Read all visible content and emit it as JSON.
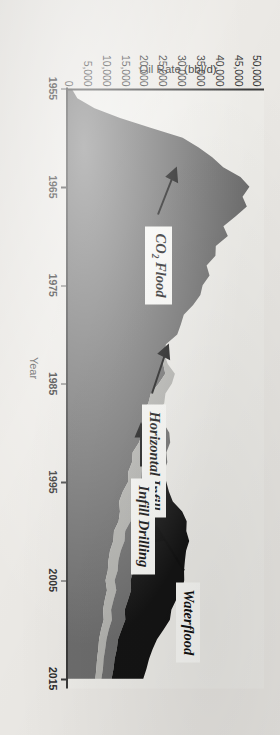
{
  "figure": {
    "rotation_deg": 90,
    "background_hex": "#eceae6"
  },
  "axes": {
    "x_title": "Year",
    "y_title": "Oil Rate (bbl/d)",
    "x_ticks": [
      "1955",
      "1965",
      "1975",
      "1985",
      "1995",
      "2005",
      "2015"
    ],
    "y_ticks": [
      "0",
      "5,000",
      "10,000",
      "15,000",
      "20,000",
      "25,000",
      "30,000",
      "35,000",
      "40,000",
      "45,000",
      "50,000"
    ],
    "axis_color_hex": "#3b3b3b"
  },
  "annotations": [
    {
      "id": "co2-flood",
      "label_html": "CO<sub>2</sub> Flood",
      "label_text": "CO2 Flood"
    },
    {
      "id": "horizontal-infill",
      "label_html": "Horizontal Infill",
      "label_text": "Horizontal Infill"
    },
    {
      "id": "infill-drilling",
      "label_html": "Infill Drilling",
      "label_text": "Infill Drilling"
    },
    {
      "id": "waterflood",
      "label_html": "Waterflood",
      "label_text": "Waterflood"
    }
  ],
  "chart_data": {
    "type": "area",
    "title": "",
    "subtitle": "",
    "xlabel": "Year",
    "ylabel": "Oil Rate (bbl/d)",
    "xlim": [
      1955,
      2016
    ],
    "ylim": [
      0,
      52000
    ],
    "grid": false,
    "legend_position": "none",
    "stacked": true,
    "series": [
      {
        "name": "Waterflood",
        "color_hex": "#6e6e6e",
        "values": [
          900,
          2600,
          7000,
          14000,
          22000,
          30000,
          36000,
          39000,
          41000,
          43500,
          46500,
          48000,
          45000,
          43000,
          41500,
          40500,
          39500,
          38500,
          37500,
          36500,
          35500,
          34500,
          33500,
          32000,
          30500,
          29000,
          27500,
          26500,
          25500,
          24500,
          23500,
          22500,
          21500,
          20500,
          19500,
          18800,
          18000,
          17200,
          16500,
          15800,
          15200,
          14600,
          14000,
          13500,
          13000,
          12500,
          12000,
          11600,
          11200,
          10800,
          10400,
          10000,
          9700,
          9400,
          9100,
          8800,
          8500,
          8200,
          8000,
          7800,
          7600
        ]
      },
      {
        "name": "Infill Drilling",
        "color_hex": "#b4b4b0",
        "values": [
          0,
          0,
          0,
          0,
          0,
          0,
          0,
          0,
          0,
          0,
          0,
          0,
          0,
          0,
          0,
          0,
          0,
          0,
          0,
          0,
          0,
          0,
          0,
          0,
          0,
          0,
          0,
          0,
          1200,
          2600,
          3400,
          3900,
          4100,
          4200,
          4100,
          4000,
          3900,
          3800,
          3700,
          3600,
          3500,
          3400,
          3300,
          3200,
          3100,
          3000,
          2900,
          2800,
          2700,
          2600,
          2500,
          2400,
          2300,
          2200,
          2100,
          2000,
          1900,
          1800,
          1750,
          1700,
          1650
        ]
      },
      {
        "name": "Horizontal Infill",
        "color_hex": "#6e6e6e",
        "values": [
          0,
          0,
          0,
          0,
          0,
          0,
          0,
          0,
          0,
          0,
          0,
          0,
          0,
          0,
          0,
          0,
          0,
          0,
          0,
          0,
          0,
          0,
          0,
          0,
          0,
          0,
          0,
          0,
          0,
          0,
          0,
          0,
          0,
          0,
          1500,
          3200,
          4400,
          5200,
          5600,
          5800,
          5900,
          5800,
          5700,
          5500,
          5300,
          5100,
          4900,
          4700,
          4500,
          4300,
          4100,
          3900,
          3750,
          3600,
          3450,
          3300,
          3150,
          3000,
          2900,
          2800,
          2700
        ]
      },
      {
        "name": "CO2 Flood",
        "color_hex": "#141414",
        "values": [
          0,
          0,
          0,
          0,
          0,
          0,
          0,
          0,
          0,
          0,
          0,
          0,
          0,
          0,
          0,
          0,
          0,
          0,
          0,
          0,
          0,
          0,
          0,
          0,
          0,
          0,
          0,
          0,
          0,
          0,
          0,
          0,
          0,
          0,
          0,
          0,
          0,
          0,
          0,
          0,
          900,
          2800,
          5200,
          7500,
          9500,
          11000,
          12200,
          13000,
          13500,
          13800,
          14000,
          13600,
          13000,
          12300,
          11600,
          11000,
          10400,
          9800,
          9200,
          8700,
          8200
        ]
      }
    ],
    "x": [
      1955,
      1956,
      1957,
      1958,
      1959,
      1960,
      1961,
      1962,
      1963,
      1964,
      1965,
      1966,
      1967,
      1968,
      1969,
      1970,
      1971,
      1972,
      1973,
      1974,
      1975,
      1976,
      1977,
      1978,
      1979,
      1980,
      1981,
      1982,
      1983,
      1984,
      1985,
      1986,
      1987,
      1988,
      1989,
      1990,
      1991,
      1992,
      1993,
      1994,
      1995,
      1996,
      1997,
      1998,
      1999,
      2000,
      2001,
      2002,
      2003,
      2004,
      2005,
      2006,
      2007,
      2008,
      2009,
      2010,
      2011,
      2012,
      2013,
      2014,
      2015
    ]
  }
}
